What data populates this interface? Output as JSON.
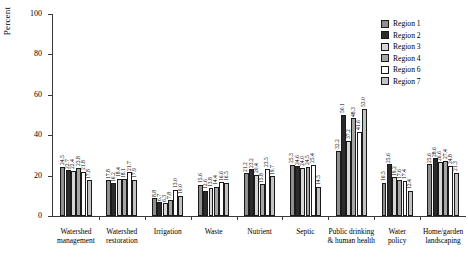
{
  "chart_data": {
    "type": "bar",
    "title": "",
    "xlabel": "",
    "ylabel": "Percent",
    "ylim": [
      0,
      100
    ],
    "yticks": [
      0,
      20,
      40,
      60,
      80,
      100
    ],
    "ytick_labels": [
      "0",
      "20",
      "40",
      "60",
      "80",
      "100"
    ],
    "grid": false,
    "legend_position": "top-right",
    "categories": [
      "Watershed management",
      "Watershed restoration",
      "Irrigation",
      "Waste",
      "Nutrient",
      "Septic",
      "Public drinking & human health",
      "Water policy",
      "Home/garden landscaping"
    ],
    "category_lines": [
      [
        "Watershed",
        "management"
      ],
      [
        "Watershed",
        "restoration"
      ],
      [
        "Irrigation"
      ],
      [
        "Waste"
      ],
      [
        "Nutrient"
      ],
      [
        "Septic"
      ],
      [
        "Public drinking",
        "& human health"
      ],
      [
        "Water",
        "policy"
      ],
      [
        "Home/garden",
        "landscaping"
      ]
    ],
    "series": [
      {
        "name": "Region 1",
        "color": "#8f8f8f",
        "values": [
          24.5,
          17.8,
          8.8,
          15.6,
          21.2,
          25.3,
          32.2,
          16.5,
          25.6
        ]
      },
      {
        "name": "Region 2",
        "color": "#2b2b2b",
        "values": [
          22.7,
          16.2,
          6.7,
          12.6,
          23.2,
          24.6,
          50.1,
          25.6,
          28.6
        ]
      },
      {
        "name": "Region 3",
        "color": "#d6d6d6",
        "values": [
          22.4,
          18.4,
          6.3,
          13.8,
          20.4,
          24.0,
          37.2,
          19.2,
          26.6
        ]
      },
      {
        "name": "Region 4",
        "color": "#a5a5a5",
        "values": [
          23.8,
          18.1,
          7.8,
          14.4,
          15.8,
          24.5,
          48.3,
          17.6,
          27.4
        ]
      },
      {
        "name": "Region 6",
        "color": "#ffffff",
        "values": [
          21.8,
          21.7,
          13.0,
          16.6,
          23.5,
          25.4,
          41.6,
          17.4,
          24.8
        ]
      },
      {
        "name": "Region 7",
        "color": "#c2c2c2",
        "values": [
          17.8,
          17.9,
          10.0,
          16.5,
          19.7,
          14.5,
          53.0,
          12.4,
          21.3
        ]
      }
    ]
  }
}
